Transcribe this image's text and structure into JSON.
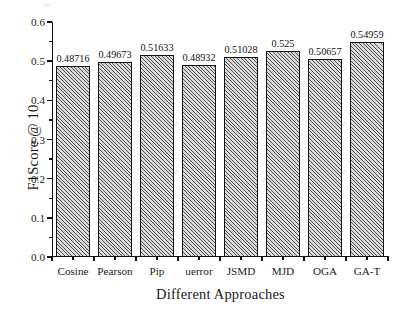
{
  "chart_data": {
    "type": "bar",
    "title": "",
    "xlabel": "Different Approaches",
    "ylabel": "F1Score @ 10",
    "categories": [
      "Cosine",
      "Pearson",
      "Pip",
      "uerror",
      "JSMD",
      "MJD",
      "OGA",
      "GA-T"
    ],
    "values": [
      0.48716,
      0.49673,
      0.51633,
      0.48932,
      0.51028,
      0.525,
      0.50657,
      0.54959
    ],
    "value_labels": [
      "0.48716",
      "0.49673",
      "0.51633",
      "0.48932",
      "0.51028",
      "0.525",
      "0.50657",
      "0.54959"
    ],
    "ylim": [
      0.0,
      0.6
    ],
    "ytick_labels": [
      "0.0",
      "0.1",
      "0.2",
      "0.3",
      "0.4",
      "0.5",
      "0.6"
    ],
    "ytick_values": [
      0.0,
      0.1,
      0.2,
      0.3,
      0.4,
      0.5,
      0.6
    ],
    "yminor_values": [
      0.05,
      0.15,
      0.25,
      0.35,
      0.45,
      0.55
    ],
    "grid": false,
    "legend": null,
    "bar_fill_color": "#d9d9d9",
    "bar_edge_color": "#141414",
    "bar_hatch": "diagonal-forward",
    "axis_color": "#111111"
  }
}
